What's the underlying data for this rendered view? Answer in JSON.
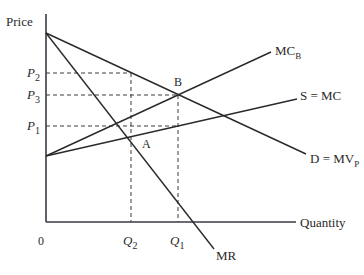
{
  "diagram": {
    "type": "economics-supply-demand",
    "axes": {
      "y_label": "Price",
      "x_label": "Quantity",
      "origin_label": "0"
    },
    "price_levels": [
      {
        "id": "P2",
        "base": "P",
        "sub": "2"
      },
      {
        "id": "P3",
        "base": "P",
        "sub": "3"
      },
      {
        "id": "P1",
        "base": "P",
        "sub": "1"
      }
    ],
    "quantity_levels": [
      {
        "id": "Q2",
        "base": "Q",
        "sub": "2"
      },
      {
        "id": "Q1",
        "base": "Q",
        "sub": "1"
      }
    ],
    "curves": {
      "mc_b": {
        "base": "MC",
        "sub": "B"
      },
      "supply": {
        "label": "S = MC"
      },
      "demand": {
        "base": "D = MV",
        "sub": "P"
      },
      "mr": {
        "label": "MR"
      }
    },
    "points": {
      "a": "A",
      "b": "B"
    },
    "colors": {
      "axis": "#3a3a46",
      "line": "#2a2a2a"
    }
  }
}
